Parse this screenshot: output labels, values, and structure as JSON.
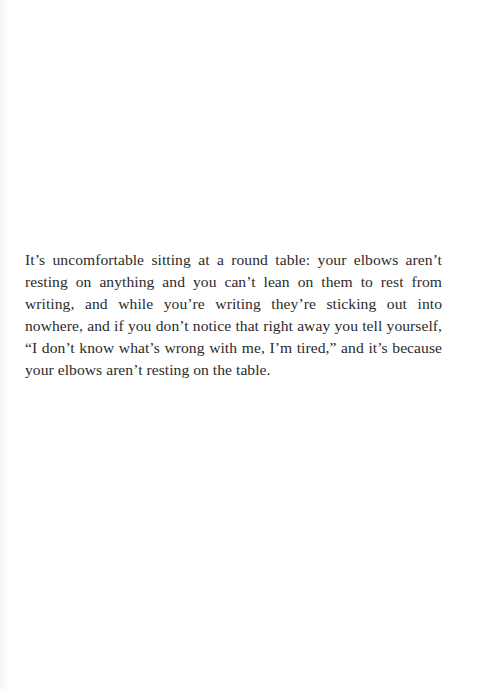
{
  "document": {
    "paragraph": "It’s uncomfortable sitting at a round table: your elbows aren’t resting on anything and you can’t lean on them to rest from writing, and while you’re writing they’re sticking out into nowhere, and if you don’t notice that right away you tell yourself, “I don’t know what’s wrong with me, I’m tired,” and it’s because your elbows aren’t resting on the table."
  }
}
